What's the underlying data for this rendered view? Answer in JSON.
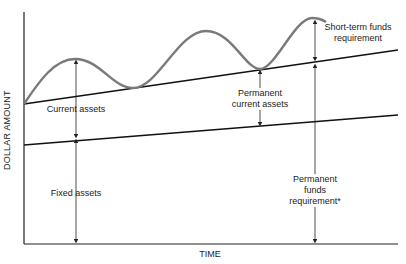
{
  "diagram": {
    "type": "funds-requirement-over-time",
    "axes": {
      "x_label": "TIME",
      "y_label": "DOLLAR AMOUNT"
    },
    "lines": [
      {
        "name": "total-permanent-assets-line",
        "description": "Upper rising straight line (fixed + permanent current assets)"
      },
      {
        "name": "fixed-assets-line",
        "description": "Lower rising straight line"
      },
      {
        "name": "total-assets-curve",
        "description": "Wavy curve above upper line (seasonal current assets)"
      }
    ],
    "labels": {
      "current_assets": "Current assets",
      "fixed_assets": "Fixed assets",
      "permanent_current_assets_1": "Permanent",
      "permanent_current_assets_2": "current assets",
      "short_term_1": "Short-term funds",
      "short_term_2": "requirement",
      "permanent_funds_1": "Permanent",
      "permanent_funds_2": "funds",
      "permanent_funds_3": "requirement*"
    },
    "colors": {
      "axis": "#222222",
      "lines": "#111111",
      "curve": "#7a7a7a",
      "text": "#222222"
    }
  }
}
